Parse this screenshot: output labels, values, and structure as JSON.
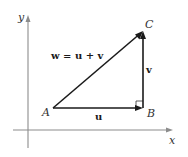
{
  "diagram": {
    "axes": {
      "x_label": "x",
      "y_label": "y",
      "color": "#8c8c8c"
    },
    "points": {
      "A": {
        "label": "A"
      },
      "B": {
        "label": "B"
      },
      "C": {
        "label": "C"
      }
    },
    "vectors": [
      {
        "name": "u",
        "label": "u",
        "from": "A",
        "to": "B"
      },
      {
        "name": "v",
        "label": "v",
        "from": "B",
        "to": "C"
      },
      {
        "name": "w",
        "label": "w",
        "from": "A",
        "to": "C"
      }
    ],
    "equation": "w = u + v",
    "right_angle_at": "B",
    "vector_color": "#1a1a1a"
  }
}
